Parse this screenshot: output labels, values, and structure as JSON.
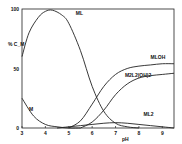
{
  "chart_data": {
    "type": "line",
    "title": "",
    "xlabel": "pH",
    "ylabel": "% C_M",
    "xlim": [
      3,
      9.5
    ],
    "ylim": [
      0,
      100
    ],
    "xticks": [
      "3",
      "4",
      "5",
      "6",
      "7",
      "8",
      "9"
    ],
    "yticks": [
      "0",
      "50",
      "100"
    ],
    "grid": false,
    "series": [
      {
        "name": "M",
        "x": [
          3,
          3.5,
          4,
          4.5,
          5,
          5.5
        ],
        "y": [
          25,
          10,
          3,
          1,
          0,
          0
        ]
      },
      {
        "name": "ML",
        "x": [
          3,
          3.3,
          3.7,
          4,
          4.3,
          4.7,
          5,
          5.5,
          6,
          6.5,
          7,
          7.5,
          8
        ],
        "y": [
          60,
          80,
          93,
          98,
          99,
          95,
          88,
          65,
          35,
          14,
          4,
          1,
          0
        ]
      },
      {
        "name": "MLOH",
        "x": [
          5,
          5.5,
          6,
          6.5,
          7,
          7.5,
          8,
          8.5,
          9,
          9.5
        ],
        "y": [
          0,
          6,
          20,
          35,
          45,
          50,
          52,
          53,
          54,
          54
        ]
      },
      {
        "name": "M2L2(OH)2",
        "x": [
          5.5,
          6,
          6.5,
          7,
          7.5,
          8,
          8.5,
          9,
          9.5
        ],
        "y": [
          0,
          5,
          15,
          28,
          37,
          42,
          44,
          45,
          46
        ]
      },
      {
        "name": "ML2",
        "x": [
          4.5,
          5,
          5.5,
          6,
          6.5,
          7,
          7.5,
          8,
          8.5,
          9,
          9.5
        ],
        "y": [
          0,
          1,
          2,
          3,
          4,
          4.5,
          4,
          3,
          2,
          1,
          0
        ]
      }
    ],
    "annotations": [
      "M",
      "ML",
      "MLOH",
      "M2L2(OH)2",
      "ML2"
    ]
  }
}
